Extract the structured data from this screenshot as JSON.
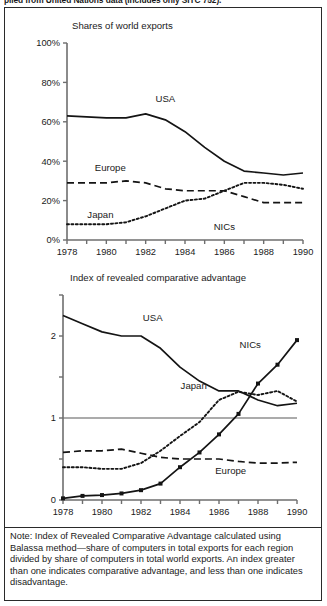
{
  "top_caption": "piled from United Nations data (includes only SITC 752).",
  "note": "Note: Index of Revealed Comparative Advantage calculated using Balassa method—share of computers in total exports for each region divided by share of computers in total world exports. An index greater than one indicates comparative advantage, and less than one indicates disadvantage.",
  "chart_data": [
    {
      "type": "line",
      "title": "Shares of world exports",
      "xlabel": "",
      "ylabel": "",
      "x": [
        1978,
        1979,
        1980,
        1981,
        1982,
        1983,
        1984,
        1985,
        1986,
        1987,
        1988,
        1989,
        1990
      ],
      "xlim": [
        1978,
        1990
      ],
      "ylim": [
        0,
        100
      ],
      "xticks": [
        1978,
        1979,
        1980,
        1981,
        1982,
        1983,
        1984,
        1985,
        1986,
        1987,
        1988,
        1989,
        1990
      ],
      "xticklabels": [
        "1978",
        "",
        "1980",
        "",
        "1982",
        "",
        "1984",
        "",
        "1986",
        "",
        "1988",
        "",
        "1990"
      ],
      "yticks": [
        0,
        20,
        40,
        60,
        80,
        100
      ],
      "yticklabels": [
        "0%",
        "20%",
        "40%",
        "60%",
        "80%",
        "100%"
      ],
      "grid": false,
      "legend": "inline-labels",
      "series": [
        {
          "name": "USA",
          "style": "solid",
          "label_x": 1983.0,
          "label_y": 70,
          "values": [
            63,
            62.5,
            62,
            62,
            64,
            61,
            55,
            47,
            40,
            35,
            34,
            33,
            34
          ]
        },
        {
          "name": "Europe",
          "style": "dashed",
          "label_x": 1980.2,
          "label_y": 35,
          "values": [
            29,
            29,
            29,
            30,
            29,
            26,
            25,
            25,
            25,
            22,
            19,
            19,
            19
          ]
        },
        {
          "name": "Japan",
          "style": "dotted",
          "label_x": 1979.7,
          "label_y": 11,
          "values": [
            8,
            8,
            8,
            9,
            12,
            16,
            20,
            21,
            25,
            29,
            29,
            28,
            26
          ]
        },
        {
          "name": "NICs",
          "style": "dotted",
          "label_x": 1986.0,
          "label_y": 5,
          "values": [
            null,
            null,
            null,
            null,
            null,
            null,
            null,
            null,
            null,
            null,
            null,
            null,
            null
          ]
        }
      ]
    },
    {
      "type": "line",
      "title": "Index of revealed comparative advantage",
      "xlabel": "",
      "ylabel": "",
      "x": [
        1978,
        1979,
        1980,
        1981,
        1982,
        1983,
        1984,
        1985,
        1986,
        1987,
        1988,
        1989,
        1990
      ],
      "xlim": [
        1978,
        1990
      ],
      "ylim": [
        0,
        2.5
      ],
      "xticks": [
        1978,
        1979,
        1980,
        1981,
        1982,
        1983,
        1984,
        1985,
        1986,
        1987,
        1988,
        1989,
        1990
      ],
      "xticklabels": [
        "1978",
        "",
        "1980",
        "",
        "1982",
        "",
        "1984",
        "",
        "1986",
        "",
        "1988",
        "",
        "1990"
      ],
      "yticks": [
        0,
        0.5,
        1,
        1.5,
        2,
        2.5
      ],
      "yticklabels": [
        "0",
        "",
        "1",
        "",
        "2",
        ""
      ],
      "reference_line": 1,
      "grid": false,
      "legend": "inline-labels",
      "series": [
        {
          "name": "USA",
          "style": "solid",
          "label_x": 1982.6,
          "label_y": 2.18,
          "markers": false,
          "values": [
            2.25,
            2.15,
            2.05,
            2.0,
            2.0,
            1.85,
            1.62,
            1.45,
            1.33,
            1.33,
            1.22,
            1.15,
            1.18
          ]
        },
        {
          "name": "Japan",
          "style": "dotted",
          "label_x": 1984.7,
          "label_y": 1.35,
          "markers": false,
          "values": [
            0.4,
            0.4,
            0.38,
            0.38,
            0.45,
            0.6,
            0.78,
            0.95,
            1.22,
            1.32,
            1.28,
            1.33,
            1.2
          ]
        },
        {
          "name": "Europe",
          "style": "dashed",
          "label_x": 1986.6,
          "label_y": 0.32,
          "markers": false,
          "values": [
            0.58,
            0.6,
            0.6,
            0.62,
            0.57,
            0.52,
            0.5,
            0.5,
            0.5,
            0.47,
            0.45,
            0.45,
            0.46
          ]
        },
        {
          "name": "NICs",
          "style": "solid-markers",
          "label_x": 1987.6,
          "label_y": 1.85,
          "markers": true,
          "values": [
            0.02,
            0.05,
            0.06,
            0.08,
            0.12,
            0.2,
            0.4,
            0.58,
            0.8,
            1.05,
            1.42,
            1.65,
            1.95
          ]
        }
      ]
    }
  ]
}
